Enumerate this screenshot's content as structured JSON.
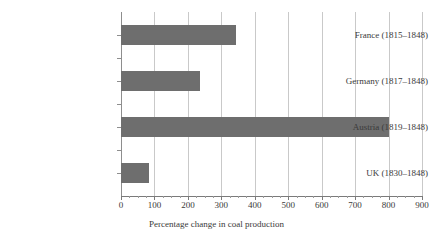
{
  "chart_data": {
    "type": "bar",
    "orientation": "horizontal",
    "title": "",
    "subtitle": "",
    "xlabel": "Percentage change in coal production",
    "ylabel": "",
    "categories": [
      "France (1815–1848)",
      "Germany (1817–1848)",
      "Austria (1819–1848)",
      "UK (1830–1848)"
    ],
    "values": [
      345,
      235,
      800,
      85
    ],
    "series": [
      {
        "name": "Percentage change in coal production",
        "values": [
          345,
          235,
          800,
          85
        ]
      }
    ],
    "xlim": [
      0,
      900
    ],
    "xticks": [
      0,
      100,
      200,
      300,
      400,
      500,
      600,
      700,
      800,
      900
    ],
    "xtick_labels": [
      "0",
      "100",
      "200",
      "300",
      "400",
      "500",
      "600",
      "700",
      "800",
      "900"
    ],
    "xtick_minor_step": 25,
    "grid": {
      "vertical": true,
      "horizontal": false,
      "color": "#c9c9c9"
    },
    "legend": {
      "visible": false,
      "position": "none"
    },
    "colors": {
      "bar_fill": "#6e6e6e",
      "gridline": "#c9c9c9",
      "axis": "#7a7a7a",
      "background": "#ffffff",
      "text": "#3a3a3a"
    },
    "annotations": []
  }
}
